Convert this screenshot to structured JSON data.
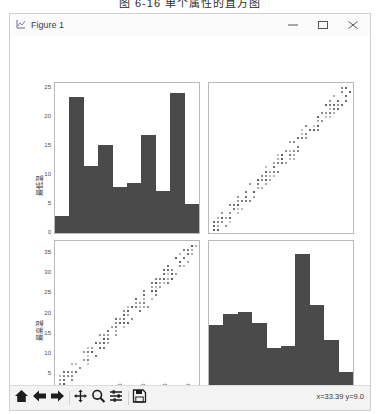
{
  "caption": "图 6-16  单个属性的直方图",
  "window": {
    "title": "Figure 1",
    "icon": "figure-icon",
    "minimize_label": "–",
    "maximize_label": "□",
    "close_label": "×"
  },
  "toolbar": {
    "buttons": [
      {
        "name": "home-button",
        "label": "Home",
        "icon": "home-icon"
      },
      {
        "name": "back-button",
        "label": "Back",
        "icon": "arrow-left-icon"
      },
      {
        "name": "forward-button",
        "label": "Forward",
        "icon": "arrow-right-icon"
      },
      {
        "name": "pan-button",
        "label": "Pan",
        "icon": "move-icon"
      },
      {
        "name": "zoom-button",
        "label": "Zoom to rectangle",
        "icon": "magnifier-icon"
      },
      {
        "name": "subplots-button",
        "label": "Configure subplots",
        "icon": "sliders-icon"
      },
      {
        "name": "save-button",
        "label": "Save the figure",
        "icon": "floppy-icon"
      }
    ],
    "coordinates": "x=33.39  y=9.0"
  },
  "chart_data": [
    {
      "type": "bar",
      "position": "top-left",
      "title": "",
      "xlabel": "最低温",
      "ylabel": "最低温",
      "categories": [
        "0",
        "5",
        "10",
        "15",
        "20",
        "25"
      ],
      "bin_edges": [
        -3.5,
        -0.3,
        2.9,
        6.1,
        9.3,
        12.5,
        15.7,
        18.9,
        22.1,
        25.3,
        28.5
      ],
      "values": [
        3,
        23.5,
        11.7,
        15.3,
        8,
        8.6,
        17,
        7.2,
        24.3,
        5
      ],
      "ylim": [
        0,
        26
      ],
      "xlim": [
        -3.5,
        28.5
      ],
      "yticks": [
        0,
        5,
        10,
        15,
        20,
        25
      ],
      "xticks": [
        0,
        5,
        10,
        15,
        20,
        25
      ],
      "grid": false,
      "legend": "none",
      "bar_color": "#4a4a4a"
    },
    {
      "type": "scatter",
      "position": "top-right",
      "title": "",
      "xlabel": "最高温",
      "ylabel": "最低温",
      "xlim": [
        2,
        38
      ],
      "ylim": [
        -4,
        29
      ],
      "grid": false,
      "legend": "none",
      "point_color": "#5a5a5a",
      "correlation": "positive",
      "n_points": 180
    },
    {
      "type": "scatter",
      "position": "bottom-left",
      "title": "",
      "xlabel": "最低温",
      "ylabel": "最高温",
      "xlim": [
        -3.5,
        28.5
      ],
      "ylim": [
        2,
        38
      ],
      "yticks": [
        5,
        10,
        15,
        20,
        25,
        30,
        35
      ],
      "xticks": [
        0,
        5,
        10,
        15,
        20,
        25
      ],
      "grid": false,
      "legend": "none",
      "point_color": "#5a5a5a",
      "correlation": "positive",
      "n_points": 180
    },
    {
      "type": "bar",
      "position": "bottom-right",
      "title": "",
      "xlabel": "最高温",
      "ylabel": "最高温",
      "categories": [
        "10",
        "20",
        "30"
      ],
      "bin_edges": [
        3.0,
        6.4,
        9.8,
        13.2,
        16.6,
        20.0,
        23.4,
        26.8,
        30.2,
        33.6,
        37.0
      ],
      "values": [
        14.5,
        17,
        17.5,
        15,
        9,
        9.5,
        31,
        19,
        11,
        3.5
      ],
      "ylim": [
        0,
        34
      ],
      "xlim": [
        3,
        37
      ],
      "xticks": [
        10,
        20,
        30
      ],
      "grid": false,
      "legend": "none",
      "bar_color": "#4a4a4a"
    }
  ]
}
